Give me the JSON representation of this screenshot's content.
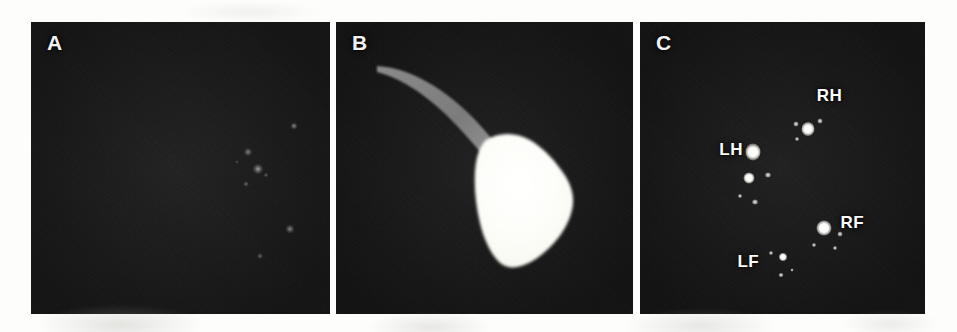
{
  "figure": {
    "background_color": "#fdfdfc",
    "panel_background_color": "#121212",
    "panel_count": 3
  },
  "panels": [
    {
      "id": "a",
      "letter": "A",
      "description": "Dark-field bioluminescence image with faint dim foci in the right-central region",
      "signal_intensity": "low",
      "foci": [
        {
          "name": "focus-1",
          "x": 72.5,
          "y": 44.5,
          "w": 9,
          "h": 9,
          "brightness": 0.55
        },
        {
          "name": "focus-2",
          "x": 75.8,
          "y": 50.5,
          "w": 11,
          "h": 11,
          "brightness": 0.72
        },
        {
          "name": "focus-3",
          "x": 72.0,
          "y": 55.5,
          "w": 6,
          "h": 6,
          "brightness": 0.45
        },
        {
          "name": "focus-4",
          "x": 78.5,
          "y": 52.5,
          "w": 5,
          "h": 5,
          "brightness": 0.4
        },
        {
          "name": "focus-5",
          "x": 88.0,
          "y": 35.5,
          "w": 7,
          "h": 8,
          "brightness": 0.6
        },
        {
          "name": "focus-6",
          "x": 86.5,
          "y": 71.0,
          "w": 9,
          "h": 10,
          "brightness": 0.58
        },
        {
          "name": "focus-7",
          "x": 76.5,
          "y": 80.0,
          "w": 6,
          "h": 7,
          "brightness": 0.42
        },
        {
          "name": "focus-8",
          "x": 69.0,
          "y": 48.0,
          "w": 4,
          "h": 4,
          "brightness": 0.3
        }
      ]
    },
    {
      "id": "b",
      "letter": "B",
      "description": "Bright white bulbous specimen body with a tapering gray curved tail extending to the upper left",
      "signal_intensity": "high",
      "specimen": {
        "body_color": "#fdfdf8",
        "tail_color": "#7d7d7d",
        "tail_start": {
          "x": 14,
          "y": 14
        },
        "body_center": {
          "x": 62,
          "y": 66
        }
      }
    },
    {
      "id": "c",
      "letter": "C",
      "description": "Dark-field bioluminescence image with four bright labelled limb foci",
      "signal_intensity": "high",
      "labels": [
        {
          "name": "label-rh",
          "text": "RH",
          "x": 66.5,
          "y": 25.0
        },
        {
          "name": "label-lh",
          "text": "LH",
          "x": 32.0,
          "y": 43.5
        },
        {
          "name": "label-rf",
          "text": "RF",
          "x": 74.5,
          "y": 68.5
        },
        {
          "name": "label-lf",
          "text": "LF",
          "x": 38.0,
          "y": 82.0
        }
      ],
      "foci": [
        {
          "name": "focus-rh-main",
          "x": 58.8,
          "y": 36.5,
          "w": 13,
          "h": 14,
          "type": "bright"
        },
        {
          "name": "focus-rh-sat-1",
          "x": 54.6,
          "y": 35.0,
          "w": 5,
          "h": 5,
          "type": "speck"
        },
        {
          "name": "focus-rh-sat-2",
          "x": 63.3,
          "y": 34.0,
          "w": 5,
          "h": 5,
          "type": "speck"
        },
        {
          "name": "focus-rh-sat-3",
          "x": 55.2,
          "y": 40.0,
          "w": 4,
          "h": 4,
          "type": "speck"
        },
        {
          "name": "focus-lh-main",
          "x": 39.5,
          "y": 44.5,
          "w": 15,
          "h": 17,
          "type": "bright"
        },
        {
          "name": "focus-lh-sat-1",
          "x": 38.2,
          "y": 53.5,
          "w": 11,
          "h": 11,
          "type": "bright"
        },
        {
          "name": "focus-lh-sat-2",
          "x": 45.0,
          "y": 52.5,
          "w": 6,
          "h": 5,
          "type": "speck"
        },
        {
          "name": "focus-lh-sat-3",
          "x": 40.5,
          "y": 61.5,
          "w": 6,
          "h": 5,
          "type": "speck"
        },
        {
          "name": "focus-lh-sat-4",
          "x": 35.0,
          "y": 59.5,
          "w": 4,
          "h": 4,
          "type": "speck"
        },
        {
          "name": "focus-rf-main",
          "x": 64.5,
          "y": 70.5,
          "w": 15,
          "h": 15,
          "type": "bright"
        },
        {
          "name": "focus-rf-sat-1",
          "x": 70.0,
          "y": 72.5,
          "w": 5,
          "h": 5,
          "type": "speck"
        },
        {
          "name": "focus-rf-sat-2",
          "x": 61.0,
          "y": 76.5,
          "w": 4,
          "h": 4,
          "type": "speck"
        },
        {
          "name": "focus-rf-sat-3",
          "x": 68.5,
          "y": 77.5,
          "w": 4,
          "h": 4,
          "type": "speck"
        },
        {
          "name": "focus-lf-main",
          "x": 50.0,
          "y": 80.5,
          "w": 8,
          "h": 8,
          "type": "bright"
        },
        {
          "name": "focus-lf-sat-1",
          "x": 46.0,
          "y": 79.0,
          "w": 4,
          "h": 4,
          "type": "speck"
        },
        {
          "name": "focus-lf-sat-2",
          "x": 49.5,
          "y": 86.5,
          "w": 5,
          "h": 4,
          "type": "speck"
        },
        {
          "name": "focus-lf-sat-3",
          "x": 53.5,
          "y": 85.0,
          "w": 3,
          "h": 3,
          "type": "speck"
        }
      ]
    }
  ]
}
